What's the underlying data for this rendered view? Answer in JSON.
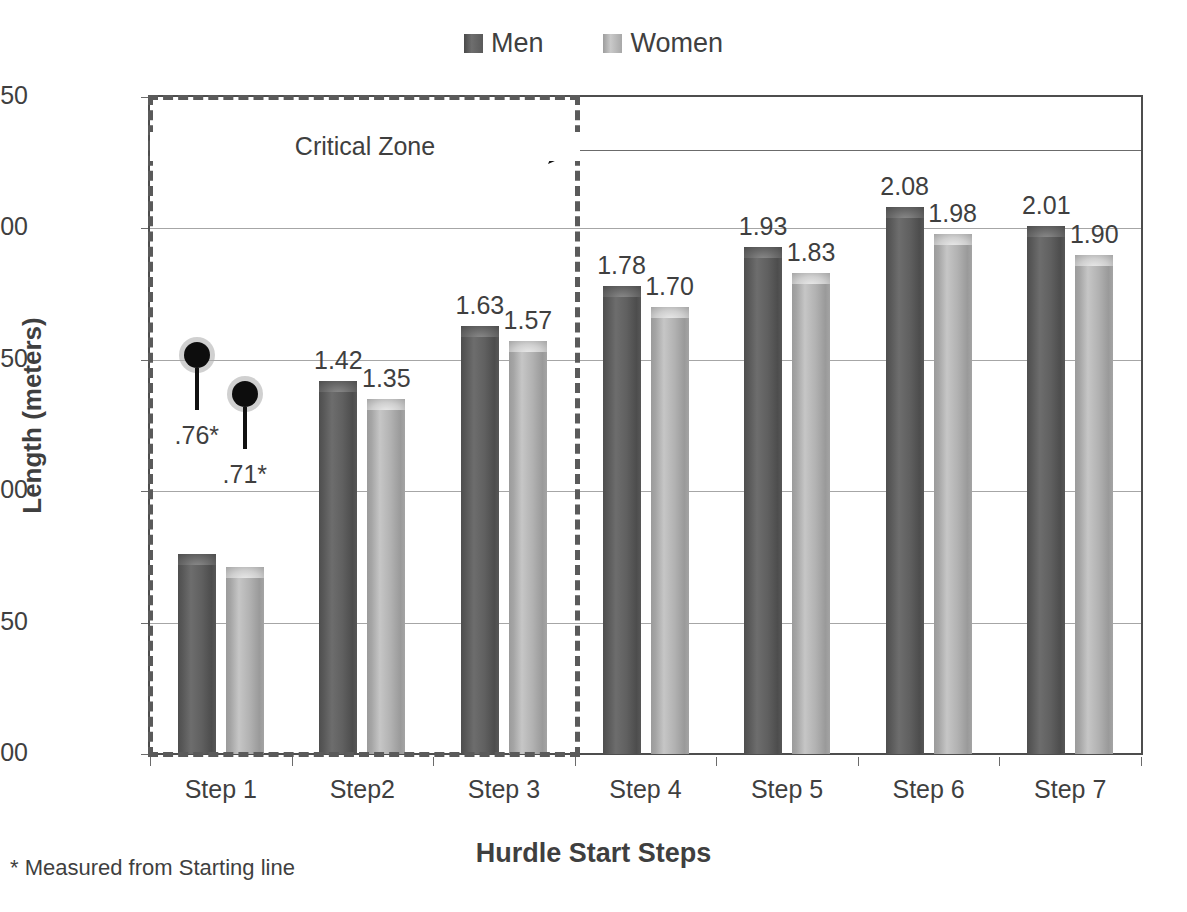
{
  "chart_data": {
    "type": "bar",
    "title": "",
    "xlabel": "Hurdle Start Steps",
    "ylabel": "Length (meters)",
    "categories": [
      "Step 1",
      "Step2",
      "Step 3",
      "Step 4",
      "Step 5",
      "Step 6",
      "Step 7"
    ],
    "series": [
      {
        "name": "Men",
        "color": "#595959",
        "values": [
          0.76,
          1.42,
          1.63,
          1.78,
          1.93,
          2.08,
          2.01
        ],
        "labels": [
          ".76*",
          "1.42",
          "1.63",
          "1.78",
          "1.93",
          "2.08",
          "2.01"
        ]
      },
      {
        "name": "Women",
        "color": "#a6a6a6",
        "values": [
          0.71,
          1.35,
          1.57,
          1.7,
          1.83,
          1.98,
          1.9
        ],
        "labels": [
          ".71*",
          "1.35",
          "1.57",
          "1.70",
          "1.83",
          "1.98",
          "1.90"
        ]
      }
    ],
    "ylim": [
      0.0,
      2.5
    ],
    "yticks": [
      "0.00",
      "0.50",
      "1.00",
      "1.50",
      "2.00",
      "2.50"
    ],
    "ytick_values": [
      0.0,
      0.5,
      1.0,
      1.5,
      2.0,
      2.5
    ],
    "grid": true,
    "legend_position": "top-center",
    "annotations": [
      {
        "name": "critical-zone",
        "text": "Critical Zone",
        "covers_categories": [
          "Step 1",
          "Step2",
          "Step 3"
        ],
        "style": "dashed-box-with-arrow"
      },
      {
        "name": "men-step1-marker",
        "text": ".76*",
        "style": "black-dot-leader"
      },
      {
        "name": "women-step1-marker",
        "text": ".71*",
        "style": "black-dot-leader"
      }
    ],
    "footnote": "* Measured from Starting line"
  },
  "legend": {
    "items": [
      {
        "label": "Men",
        "swatch": "men-swatch"
      },
      {
        "label": "Women",
        "swatch": "women-swatch"
      }
    ]
  },
  "axes": {
    "y_title": "Length (meters)",
    "x_title": "Hurdle Start Steps",
    "y_ticks": [
      "2.50",
      "2.00",
      "1.50",
      "1.00",
      "0.50",
      "0.00"
    ],
    "x_ticks": [
      "Step 1",
      "Step2",
      "Step 3",
      "Step 4",
      "Step 5",
      "Step 6",
      "Step 7"
    ]
  },
  "critical_zone": {
    "label": "Critical Zone"
  },
  "footnote": {
    "text": "* Measured from Starting line"
  },
  "colors": {
    "men": "#595959",
    "women": "#a6a6a6",
    "axis": "#4d4d4d",
    "grid": "#a6a6a6",
    "text": "#3f3f3f"
  }
}
